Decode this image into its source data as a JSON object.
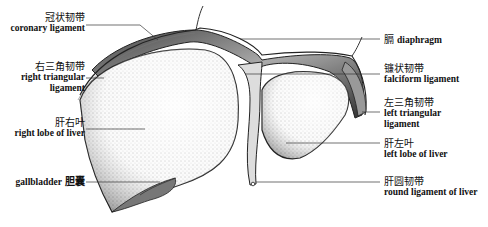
{
  "figure": {
    "labels": [
      {
        "id": "coronary",
        "zh": "冠状韧带",
        "en": "coronary ligament",
        "side": "left"
      },
      {
        "id": "right-triangular",
        "zh": "右三角韧带",
        "en": "right triangular",
        "en2": "ligament",
        "side": "left"
      },
      {
        "id": "right-lobe",
        "zh": "肝右叶",
        "en": "right lobe of liver",
        "side": "left"
      },
      {
        "id": "gallbladder",
        "zh": "胆囊",
        "en": "gallbladder",
        "side": "left"
      },
      {
        "id": "diaphragm",
        "zh": "膈",
        "en": "diaphragm",
        "side": "right"
      },
      {
        "id": "falciform",
        "zh": "镰状韧带",
        "en": "falciform ligament",
        "side": "right"
      },
      {
        "id": "left-triangular",
        "zh": "左三角韧带",
        "en": "left triangular",
        "en2": "ligament",
        "side": "right"
      },
      {
        "id": "left-lobe",
        "zh": "肝左叶",
        "en": "left lobe of liver",
        "side": "right"
      },
      {
        "id": "round",
        "zh": "肝圆韧带",
        "en": "round ligament of liver",
        "side": "right"
      }
    ]
  }
}
